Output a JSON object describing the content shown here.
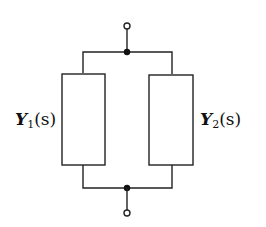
{
  "diagram": {
    "type": "parallel-admittance-circuit",
    "elements": [
      {
        "id": "Y1",
        "label_main": "Y",
        "label_sub": "1",
        "label_arg": "(s)",
        "position": "left"
      },
      {
        "id": "Y2",
        "label_main": "Y",
        "label_sub": "2",
        "label_arg": "(s)",
        "position": "right"
      }
    ],
    "terminals": [
      "top",
      "bottom"
    ],
    "nodes": [
      "top-junction",
      "bottom-junction"
    ],
    "colors": {
      "stroke": "#222222",
      "background": "#ffffff"
    }
  }
}
